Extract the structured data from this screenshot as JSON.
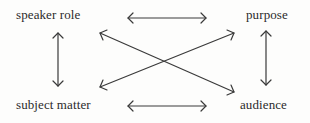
{
  "diagram": {
    "nodes": {
      "speaker_role": "speaker role",
      "purpose": "purpose",
      "subject_matter": "subject matter",
      "audience": "audience"
    },
    "edges": [
      {
        "from": "speaker role",
        "to": "purpose",
        "type": "bidirectional"
      },
      {
        "from": "speaker role",
        "to": "subject matter",
        "type": "bidirectional"
      },
      {
        "from": "purpose",
        "to": "audience",
        "type": "bidirectional"
      },
      {
        "from": "subject matter",
        "to": "audience",
        "type": "bidirectional"
      },
      {
        "from": "speaker role",
        "to": "audience",
        "type": "bidirectional"
      },
      {
        "from": "subject matter",
        "to": "purpose",
        "type": "bidirectional"
      }
    ],
    "stroke_color": "#3a3a3a",
    "text_color": "#2b2b2b"
  }
}
